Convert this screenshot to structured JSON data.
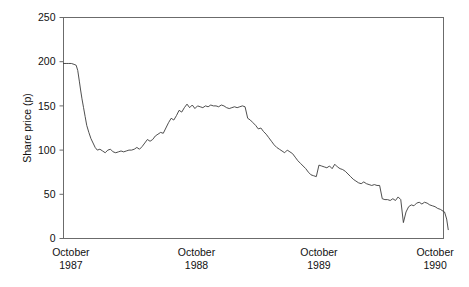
{
  "chart_data": {
    "type": "line",
    "title": "",
    "xlabel": "",
    "ylabel": "Share price (p)",
    "ylim": [
      0,
      250
    ],
    "yticks": [
      0,
      50,
      100,
      150,
      200,
      250
    ],
    "ytick_labels": [
      "0",
      "50",
      "100",
      "150",
      "200",
      "250"
    ],
    "xlim": [
      0,
      36
    ],
    "xtick_positions": [
      0.7,
      12.6,
      24.2,
      35.2
    ],
    "xtick_labels": [
      {
        "month": "October",
        "year": "1987"
      },
      {
        "month": "October",
        "year": "1988"
      },
      {
        "month": "October",
        "year": "1989"
      },
      {
        "month": "October",
        "year": "1990"
      }
    ],
    "grid": false,
    "legend": false,
    "series": [
      {
        "name": "Share price",
        "color": "#3b3b3b",
        "x": [
          0.0,
          0.25,
          0.5,
          0.75,
          1.0,
          1.2,
          1.35,
          1.5,
          1.62,
          1.75,
          1.9,
          2.05,
          2.2,
          2.4,
          2.6,
          2.8,
          3.0,
          3.2,
          3.45,
          3.7,
          3.95,
          4.2,
          4.45,
          4.7,
          4.95,
          5.2,
          5.45,
          5.7,
          5.95,
          6.2,
          6.45,
          6.7,
          6.95,
          7.2,
          7.45,
          7.7,
          7.95,
          8.2,
          8.45,
          8.7,
          8.95,
          9.2,
          9.45,
          9.7,
          9.95,
          10.2,
          10.45,
          10.7,
          10.95,
          11.2,
          11.45,
          11.7,
          11.95,
          12.2,
          12.45,
          12.7,
          12.95,
          13.2,
          13.45,
          13.7,
          13.95,
          14.2,
          14.45,
          14.7,
          14.95,
          15.2,
          15.45,
          15.7,
          15.95,
          16.2,
          16.45,
          16.7,
          16.95,
          17.2,
          17.45,
          17.7,
          17.95,
          18.2,
          18.45,
          18.7,
          18.95,
          19.2,
          19.45,
          19.7,
          19.95,
          20.2,
          20.45,
          20.7,
          20.95,
          21.2,
          21.45,
          21.7,
          21.95,
          22.2,
          22.45,
          22.7,
          22.95,
          23.2,
          23.45,
          23.7,
          23.95,
          24.2,
          24.45,
          24.7,
          24.95,
          25.2,
          25.45,
          25.7,
          25.95,
          26.2,
          26.45,
          26.7,
          26.95,
          27.2,
          27.45,
          27.7,
          27.95,
          28.2,
          28.45,
          28.7,
          28.95,
          29.2,
          29.45,
          29.7,
          29.95,
          30.2,
          30.45,
          30.7,
          30.95,
          31.2,
          31.45,
          31.7,
          31.95,
          32.2,
          32.45,
          32.7,
          32.95,
          33.2,
          33.45,
          33.7,
          33.95,
          34.2,
          34.45,
          34.7,
          34.95,
          35.2,
          35.45,
          35.7,
          35.95,
          36.1,
          36.3,
          36.45
        ],
        "y": [
          198,
          198,
          198,
          198,
          197,
          196,
          190,
          178,
          168,
          158,
          148,
          138,
          128,
          120,
          113,
          108,
          103,
          100,
          101,
          99,
          97,
          100,
          101,
          98,
          97,
          98,
          99,
          98,
          99,
          100,
          100,
          101,
          103,
          101,
          104,
          108,
          112,
          110,
          112,
          116,
          118,
          120,
          119,
          125,
          131,
          136,
          134,
          139,
          145,
          143,
          148,
          152,
          148,
          151,
          147,
          150,
          149,
          148,
          150,
          149,
          151,
          150,
          150,
          149,
          151,
          150,
          148,
          147,
          148,
          149,
          148,
          149,
          150,
          149,
          136,
          134,
          131,
          128,
          124,
          125,
          121,
          118,
          114,
          110,
          106,
          103,
          101,
          99,
          97,
          100,
          98,
          96,
          92,
          88,
          85,
          82,
          79,
          75,
          72,
          71,
          70,
          83,
          82,
          81,
          80,
          82,
          79,
          84,
          81,
          79,
          78,
          76,
          73,
          70,
          67,
          65,
          63,
          62,
          64,
          62,
          61,
          60,
          61,
          60,
          60,
          45,
          44,
          44,
          43,
          45,
          43,
          47,
          44,
          18,
          30,
          36,
          38,
          37,
          40,
          41,
          39,
          41,
          40,
          38,
          37,
          36,
          34,
          33,
          31,
          30,
          22,
          10
        ]
      }
    ]
  },
  "chart_meta": {
    "ylabel_text": "Share price (p)",
    "background_color": "#ffffff",
    "frame_color": "#6b6b6b",
    "line_color": "#3b3b3b"
  }
}
